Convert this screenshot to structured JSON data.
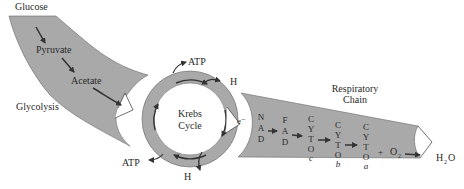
{
  "diagram": {
    "glycolysis": {
      "top_label": "Glucose",
      "steps": [
        "Pyruvate",
        "Acetate"
      ],
      "side_label": "Glycolysis"
    },
    "krebs": {
      "title_line1": "Krebs",
      "title_line2": "Cycle",
      "outputs": {
        "atp_top": "ATP",
        "h_top": "H",
        "atp_bottom": "ATP",
        "h_bottom": "H"
      },
      "electron_label": "e⁻"
    },
    "respiratory_chain": {
      "title_line1": "Respiratory",
      "title_line2": "Chain",
      "carriers": [
        {
          "letters": [
            "N",
            "A",
            "D"
          ],
          "sub": ""
        },
        {
          "letters": [
            "F",
            "A",
            "D"
          ],
          "sub": ""
        },
        {
          "letters": [
            "C",
            "Y",
            "T",
            "O"
          ],
          "sub": "c"
        },
        {
          "letters": [
            "C",
            "Y",
            "T",
            "O"
          ],
          "sub": "b"
        },
        {
          "letters": [
            "C",
            "Y",
            "T",
            "O"
          ],
          "sub": "a"
        }
      ],
      "plus": "+",
      "oxygen": "O",
      "oxygen_sub": "2",
      "product_h": "H",
      "product_sub": "2",
      "product_o": "O"
    },
    "colors": {
      "band_fill": "#a9a9a9",
      "arrow": "#333333",
      "text": "#2a2a2a"
    }
  }
}
